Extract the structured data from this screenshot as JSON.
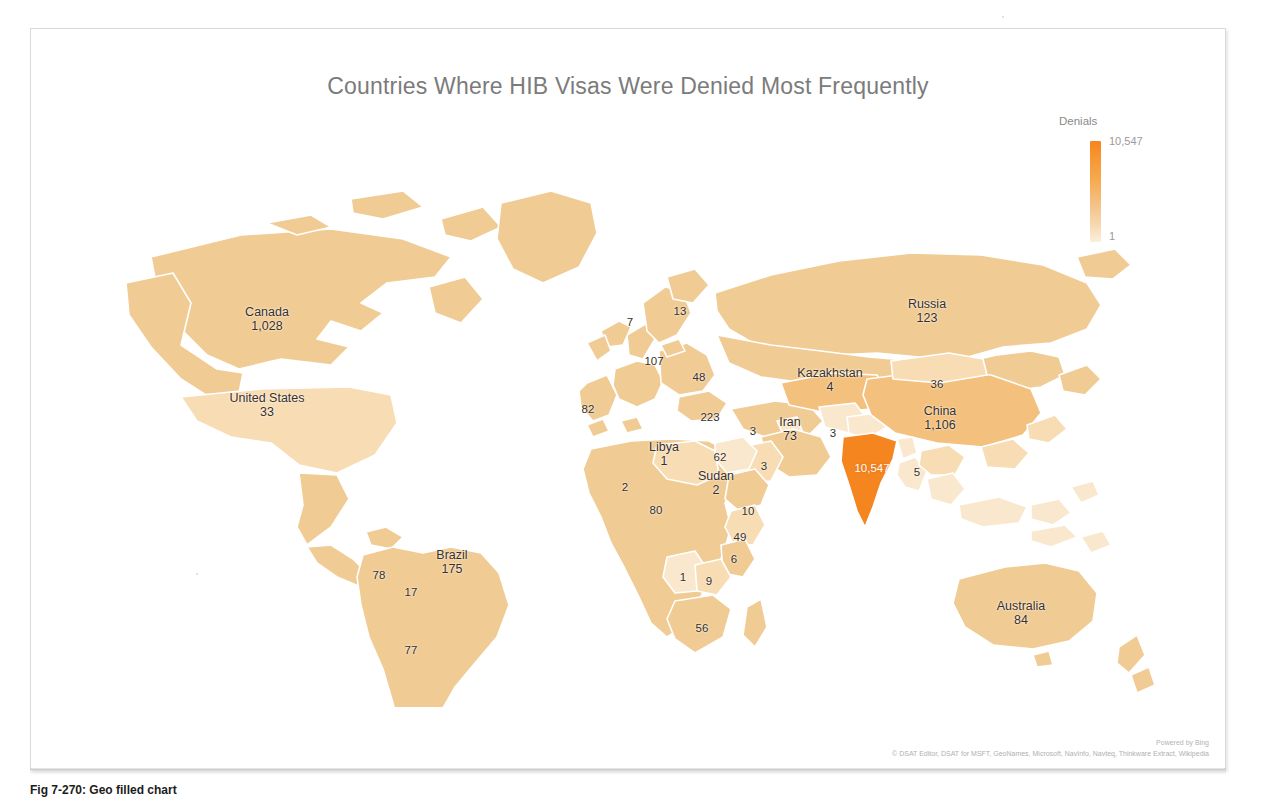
{
  "figure": {
    "title": "Countries Where HIB Visas Were Denied Most Frequently",
    "caption": "Fig 7-270: Geo filled chart"
  },
  "legend": {
    "title": "Denials",
    "max": "10,547",
    "min": "1"
  },
  "attribution": {
    "line1": "Powered by Bing",
    "line2": "© DSAT Editor, DSAT for MSFT, GeoNames, Microsoft, NavInfo, Navteq, Thinkware Extract, Wikipedia"
  },
  "colors": {
    "land_base": "#F0CB94",
    "land_light": "#F7DCB4",
    "land_pale": "#FAE8CE",
    "highlight": "#F5851F",
    "mid": "#F3C07D",
    "border": "#FFFFFF",
    "title": "#7B7B7B"
  },
  "chart_data": {
    "type": "map",
    "title": "Countries Where HIB Visas Were Denied Most Frequently",
    "value_label": "Denials",
    "scale_min": 1,
    "scale_max": 10547,
    "regions": [
      {
        "name": "Canada",
        "value": "1,028",
        "show_name": true,
        "x": 236,
        "y": 212,
        "fill": "#EEC68C"
      },
      {
        "name": "United States",
        "value": "33",
        "show_name": true,
        "x": 236,
        "y": 298,
        "fill": "#F6DCB6"
      },
      {
        "name": "Peru",
        "value": "78",
        "show_name": false,
        "x": 348,
        "y": 468,
        "fill": "#EEC68C"
      },
      {
        "name": "Brazil",
        "value": "175",
        "show_name": true,
        "x": 421,
        "y": 455,
        "fill": "#EDC184"
      },
      {
        "name": "Bolivia",
        "value": "17",
        "show_name": false,
        "x": 380,
        "y": 485,
        "fill": "#F4D4A6"
      },
      {
        "name": "Argentina",
        "value": "77",
        "show_name": false,
        "x": 380,
        "y": 543,
        "fill": "#EEC68C"
      },
      {
        "name": "Norway",
        "value": "7",
        "show_name": false,
        "x": 599,
        "y": 215,
        "fill": "#F7DFBC"
      },
      {
        "name": "Sweden",
        "value": "13",
        "show_name": false,
        "x": 649,
        "y": 204,
        "fill": "#F5D6AB"
      },
      {
        "name": "Germany",
        "value": "107",
        "show_name": false,
        "x": 623,
        "y": 254,
        "fill": "#EEC388"
      },
      {
        "name": "Romania",
        "value": "48",
        "show_name": false,
        "x": 668,
        "y": 270,
        "fill": "#F1CD97"
      },
      {
        "name": "Portugal",
        "value": "82",
        "show_name": false,
        "x": 557,
        "y": 302,
        "fill": "#EEC68C"
      },
      {
        "name": "Turkey",
        "value": "223",
        "show_name": false,
        "x": 679,
        "y": 310,
        "fill": "#ECBC79"
      },
      {
        "name": "Syria",
        "value": "3",
        "show_name": false,
        "x": 722,
        "y": 324,
        "fill": "#F8E2C2"
      },
      {
        "name": "Iran",
        "value": "73",
        "show_name": true,
        "x": 759,
        "y": 322,
        "fill": "#EFC88F"
      },
      {
        "name": "Afghanistan",
        "value": "3",
        "show_name": false,
        "x": 802,
        "y": 326,
        "fill": "#F8E2C2"
      },
      {
        "name": "Libya",
        "value": "1",
        "show_name": true,
        "x": 633,
        "y": 347,
        "fill": "#FAE9D2"
      },
      {
        "name": "Egypt",
        "value": "62",
        "show_name": false,
        "x": 689,
        "y": 350,
        "fill": "#F0CA92"
      },
      {
        "name": "Saudi Arabia",
        "value": "3",
        "show_name": false,
        "x": 733,
        "y": 359,
        "fill": "#F8E2C2"
      },
      {
        "name": "Sudan",
        "value": "2",
        "show_name": true,
        "x": 685,
        "y": 376,
        "fill": "#F9E5C8"
      },
      {
        "name": "Mali",
        "value": "2",
        "show_name": false,
        "x": 594,
        "y": 380,
        "fill": "#F9E5C8"
      },
      {
        "name": "Nigeria",
        "value": "80",
        "show_name": false,
        "x": 625,
        "y": 403,
        "fill": "#EEC68C"
      },
      {
        "name": "Ethiopia",
        "value": "10",
        "show_name": false,
        "x": 717,
        "y": 404,
        "fill": "#F6D9B0"
      },
      {
        "name": "Kenya",
        "value": "49",
        "show_name": false,
        "x": 709,
        "y": 430,
        "fill": "#F1CD97"
      },
      {
        "name": "Tanzania",
        "value": "6",
        "show_name": false,
        "x": 703,
        "y": 452,
        "fill": "#F7DEB8"
      },
      {
        "name": "Angola",
        "value": "1",
        "show_name": false,
        "x": 652,
        "y": 470,
        "fill": "#FAE9D2"
      },
      {
        "name": "Zambia",
        "value": "9",
        "show_name": false,
        "x": 678,
        "y": 474,
        "fill": "#F6DAB2"
      },
      {
        "name": "South Africa",
        "value": "56",
        "show_name": false,
        "x": 671,
        "y": 521,
        "fill": "#F0CA92"
      },
      {
        "name": "Russia",
        "value": "123",
        "show_name": true,
        "x": 896,
        "y": 204,
        "fill": "#EFC88F"
      },
      {
        "name": "Kazakhstan",
        "value": "4",
        "show_name": true,
        "x": 799,
        "y": 273,
        "fill": "#F8E2C2"
      },
      {
        "name": "Mongolia",
        "value": "36",
        "show_name": false,
        "x": 906,
        "y": 277,
        "fill": "#F2CF9B"
      },
      {
        "name": "China",
        "value": "1,106",
        "show_name": true,
        "x": 909,
        "y": 311,
        "fill": "#EBB96F"
      },
      {
        "name": "India",
        "value": "10,547",
        "show_name": false,
        "x": 841,
        "y": 361,
        "fill": "#F5851F",
        "on_highlight": true
      },
      {
        "name": "Vietnam",
        "value": "5",
        "show_name": false,
        "x": 886,
        "y": 365,
        "fill": "#F8E2C2"
      },
      {
        "name": "Australia",
        "value": "84",
        "show_name": true,
        "x": 990,
        "y": 506,
        "fill": "#EEC68C"
      }
    ]
  }
}
